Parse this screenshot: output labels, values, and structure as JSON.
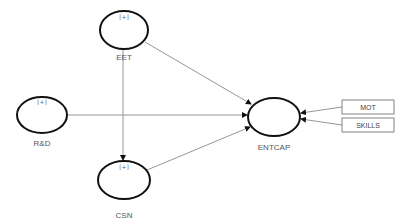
{
  "diagram": {
    "type": "structural-equation-model",
    "background": "#ffffff",
    "latent_nodes": [
      {
        "id": "EET",
        "label": "EET",
        "marker": "[+]",
        "cx": 124,
        "cy": 30,
        "rx": 24,
        "ry": 19
      },
      {
        "id": "RD",
        "label": "R&D",
        "marker": "[+]",
        "cx": 42,
        "cy": 115,
        "rx": 25,
        "ry": 19
      },
      {
        "id": "CSN",
        "label": "CSN",
        "marker": "[+]",
        "cx": 124,
        "cy": 180,
        "rx": 26,
        "ry": 19
      },
      {
        "id": "ENTCAP",
        "label": "ENTCAP",
        "marker": "",
        "cx": 274,
        "cy": 117,
        "rx": 26,
        "ry": 19
      }
    ],
    "indicators": [
      {
        "id": "MOT",
        "label": "MOT"
      },
      {
        "id": "SKILLS",
        "label": "SKILLS"
      }
    ],
    "edges": [
      {
        "from": "EET",
        "to": "ENTCAP"
      },
      {
        "from": "R&D",
        "to": "ENTCAP"
      },
      {
        "from": "CSN",
        "to": "ENTCAP"
      },
      {
        "from": "EET",
        "to": "CSN"
      },
      {
        "from": "MOT",
        "to": "ENTCAP"
      },
      {
        "from": "SKILLS",
        "to": "ENTCAP"
      }
    ]
  }
}
